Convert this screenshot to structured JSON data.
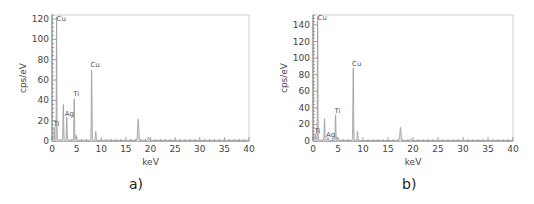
{
  "chart_data": [
    {
      "type": "line",
      "panel_label": "a)",
      "title": "",
      "xlabel": "keV",
      "ylabel": "cps/eV",
      "xlim": [
        0,
        40
      ],
      "ylim": [
        0,
        124
      ],
      "xticks": [
        0,
        5,
        10,
        15,
        20,
        25,
        30,
        35,
        40
      ],
      "yticks": [
        0,
        20,
        40,
        60,
        80,
        100,
        120
      ],
      "grid": false,
      "series": [
        {
          "name": "EDS spectrum a",
          "peaks": [
            {
              "x": 0.45,
              "y": 13
            },
            {
              "x": 0.93,
              "y": 123
            },
            {
              "x": 2.3,
              "y": 35
            },
            {
              "x": 3.0,
              "y": 23
            },
            {
              "x": 4.51,
              "y": 41
            },
            {
              "x": 4.93,
              "y": 5
            },
            {
              "x": 8.05,
              "y": 70
            },
            {
              "x": 8.9,
              "y": 9
            },
            {
              "x": 17.5,
              "y": 21
            },
            {
              "x": 19.6,
              "y": 3
            }
          ]
        }
      ],
      "annotations": [
        {
          "text": "Cu",
          "x": 0.93,
          "y": 118
        },
        {
          "text": "Ti",
          "x": 0.3,
          "y": 15
        },
        {
          "text": "Ag",
          "x": 2.6,
          "y": 25
        },
        {
          "text": "Ti",
          "x": 4.3,
          "y": 44
        },
        {
          "text": "Cu",
          "x": 7.8,
          "y": 73
        }
      ]
    },
    {
      "type": "line",
      "panel_label": "b)",
      "title": "",
      "xlabel": "keV",
      "ylabel": "cps/eV",
      "xlim": [
        0,
        40
      ],
      "ylim": [
        0,
        152
      ],
      "xticks": [
        0,
        5,
        10,
        15,
        20,
        25,
        30,
        35,
        40
      ],
      "yticks": [
        0,
        20,
        40,
        60,
        80,
        100,
        120,
        140
      ],
      "grid": false,
      "series": [
        {
          "name": "EDS spectrum b",
          "peaks": [
            {
              "x": 0.45,
              "y": 8
            },
            {
              "x": 0.93,
              "y": 152
            },
            {
              "x": 2.3,
              "y": 26
            },
            {
              "x": 3.0,
              "y": 4
            },
            {
              "x": 4.51,
              "y": 31
            },
            {
              "x": 4.93,
              "y": 4
            },
            {
              "x": 8.05,
              "y": 88
            },
            {
              "x": 8.9,
              "y": 11
            },
            {
              "x": 17.5,
              "y": 16
            },
            {
              "x": 19.6,
              "y": 2
            }
          ]
        }
      ],
      "annotations": [
        {
          "text": "Cu",
          "x": 0.93,
          "y": 146
        },
        {
          "text": "Ti",
          "x": 0.3,
          "y": 10
        },
        {
          "text": "Ag",
          "x": 2.6,
          "y": 5
        },
        {
          "text": "Ti",
          "x": 4.3,
          "y": 34
        },
        {
          "text": "Cu",
          "x": 7.8,
          "y": 91
        }
      ]
    }
  ],
  "panels": [
    {
      "caption": "a)",
      "xlabel": "keV",
      "ylabel": "cps/eV",
      "plot": {
        "left": 52,
        "top": 15,
        "right": 249,
        "bottom": 141
      },
      "ymax": 124
    },
    {
      "caption": "b)",
      "xlabel": "keV",
      "ylabel": "cps/eV",
      "plot": {
        "left": 48,
        "top": 15,
        "right": 248,
        "bottom": 141
      },
      "ymax": 152
    }
  ]
}
